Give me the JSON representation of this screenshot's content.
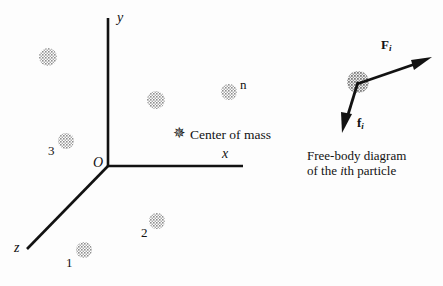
{
  "figure": {
    "background_color": "#fdfdfd",
    "ink_color": "#121212",
    "particle_fill": "#b3b3b3"
  },
  "axes": {
    "y_label": "y",
    "x_label": "x",
    "z_label": "z",
    "origin_label": "O"
  },
  "center_of_mass": {
    "marker": "asterisk-star-icon",
    "label": "Center of mass"
  },
  "particles": [
    {
      "id": "unlabeled-upper-left",
      "label": "",
      "cx": 48,
      "cy": 57,
      "r": 9
    },
    {
      "id": "particle-3",
      "label": "3",
      "cx": 66,
      "cy": 141,
      "r": 8
    },
    {
      "id": "particle-1",
      "label": "1",
      "cx": 84,
      "cy": 250,
      "r": 8
    },
    {
      "id": "particle-2",
      "label": "2",
      "cx": 157,
      "cy": 221,
      "r": 8
    },
    {
      "id": "particle-middle",
      "label": "",
      "cx": 156,
      "cy": 100,
      "r": 9
    },
    {
      "id": "particle-n",
      "label": "n",
      "cx": 229,
      "cy": 92,
      "r": 8
    }
  ],
  "free_body_diagram": {
    "particle_marker": "particle-i-icon",
    "force_external_label": "F",
    "force_external_subscript": "i",
    "force_internal_label": "f",
    "force_internal_subscript": "i",
    "caption_line1": "Free-body diagram",
    "caption_line2_prefix": "of the ",
    "caption_line2_italic": "i",
    "caption_line2_suffix": "th particle"
  }
}
